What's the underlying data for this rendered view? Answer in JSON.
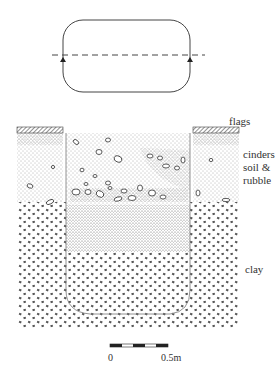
{
  "plan": {
    "description": "Plan view of feature with section line",
    "section_line": "dashed",
    "arrow_markers": 2
  },
  "section": {
    "layers": [
      {
        "label": "flags"
      },
      {
        "label": "cinders\nsoil &\nrubble",
        "lines": [
          "cinders",
          "soil &",
          "rubble"
        ]
      },
      {
        "label": "clay"
      }
    ]
  },
  "scale_bar": {
    "start_label": "0",
    "end_label": "0.5m",
    "segments": 5
  },
  "colors": {
    "ink": "#333333",
    "background": "#ffffff"
  }
}
